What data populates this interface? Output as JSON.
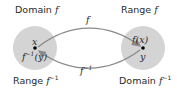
{
  "diagram": {
    "left_set": {
      "top_label": "Domain",
      "top_label_fn": "f",
      "bottom_label": "Range",
      "bottom_label_fn": "f",
      "bottom_label_exp": "−1",
      "point_label": "x",
      "point_sublabel_fn": "f",
      "point_sublabel_exp": "−1",
      "point_sublabel_arg": "(y)"
    },
    "right_set": {
      "top_label": "Range",
      "top_label_fn": "f",
      "bottom_label": "Domain",
      "bottom_label_fn": "f",
      "bottom_label_exp": "−1",
      "point_label": "f(x)",
      "point_sublabel": "y"
    },
    "arrows": {
      "forward": {
        "label": "f"
      },
      "inverse": {
        "label_fn": "f",
        "label_exp": "−1"
      }
    },
    "colors": {
      "set_fill": "#d4d4d4",
      "arrow": "#8a8a8a",
      "point": "#000000"
    }
  }
}
